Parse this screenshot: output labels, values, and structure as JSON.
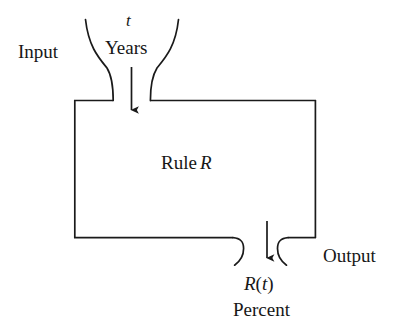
{
  "diagram": {
    "type": "function-machine-block-diagram",
    "stroke_color": "#1a1a1a",
    "background_color": "#ffffff",
    "labels": {
      "input": "Input",
      "output": "Output",
      "input_variable": "t",
      "input_units": "Years",
      "rule_text": "Rule",
      "rule_variable": "R",
      "output_variable": "R",
      "output_open_paren": "(",
      "output_arg": "t",
      "output_close_paren": ")",
      "output_expression": "R(t)",
      "output_units": "Percent"
    },
    "elements": {
      "box_name": "rule-box",
      "top_funnel_name": "input-funnel",
      "bottom_hooks_name": "output-spout",
      "input_arrow_name": "input-arrow",
      "output_arrow_name": "output-arrow"
    }
  }
}
